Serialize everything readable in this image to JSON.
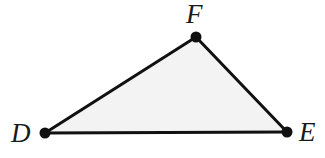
{
  "figure": {
    "kind": "geometry-diagram",
    "shape_name": "triangle",
    "width": 325,
    "height": 158,
    "background_color": "#ffffff",
    "fill_color": "#f3f3f3",
    "stroke_color": "#111111",
    "stroke_width": 3,
    "vertex_dot_color": "#111111",
    "vertex_dot_radius": 5,
    "label_color": "#1a1a1a"
  },
  "chart_data": {
    "type": "scatter",
    "title": "",
    "xlabel": "",
    "ylabel": "",
    "vertices": [
      {
        "label": "D",
        "x": 45,
        "y": 133
      },
      {
        "label": "E",
        "x": 287,
        "y": 132
      },
      {
        "label": "F",
        "x": 196,
        "y": 37
      }
    ],
    "edges": [
      {
        "from": "D",
        "to": "E"
      },
      {
        "from": "E",
        "to": "F"
      },
      {
        "from": "F",
        "to": "D"
      }
    ],
    "polygon_points": "45,133 287,132 196,37"
  },
  "labels": {
    "d": "D",
    "e": "E",
    "f": "F"
  }
}
